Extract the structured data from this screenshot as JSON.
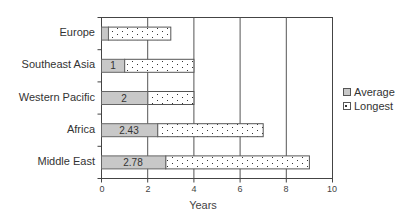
{
  "chart_data": {
    "type": "bar",
    "orientation": "horizontal",
    "stacked": true,
    "categories": [
      "Europe",
      "Southeast Asia",
      "Western Pacific",
      "Africa",
      "Middle East"
    ],
    "series": [
      {
        "name": "Average",
        "values": [
          0.3,
          1,
          2,
          2.43,
          2.78
        ],
        "color": "#c8c8c8",
        "pattern": "solid",
        "data_labels": [
          "",
          "1",
          "2",
          "2.43",
          "2.78"
        ]
      },
      {
        "name": "Longest",
        "values": [
          3,
          4,
          4,
          7,
          9
        ],
        "color": "#ffffff",
        "pattern": "dotted",
        "note": "total bar end = longest"
      }
    ],
    "title": "",
    "xlabel": "Years",
    "ylabel": "",
    "xlim": [
      0,
      10
    ],
    "xticks": [
      "0",
      "2",
      "4",
      "6",
      "8",
      "10"
    ],
    "grid": "vertical",
    "legend_position": "right"
  },
  "legend": {
    "items": [
      {
        "label": "Average"
      },
      {
        "label": "Longest"
      }
    ]
  },
  "labels": {
    "categories": [
      "Europe",
      "Southeast Asia",
      "Western Pacific",
      "Africa",
      "Middle East"
    ],
    "ticks": [
      "0",
      "2",
      "4",
      "6",
      "8",
      "10"
    ],
    "xlabel": "Years",
    "values": [
      "1",
      "2",
      "2.43",
      "2.78"
    ]
  }
}
